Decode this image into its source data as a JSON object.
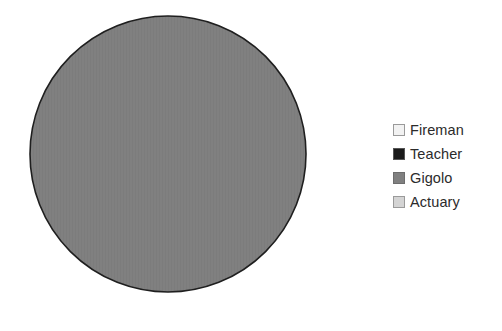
{
  "chart_data": {
    "type": "pie",
    "title": "",
    "subtitle": "",
    "xlabel": "",
    "ylabel": "",
    "grid": false,
    "legend_position": "right",
    "categories": [
      "Fireman",
      "Teacher",
      "Gigolo",
      "Actuary"
    ],
    "values": [
      0,
      0,
      100,
      0
    ],
    "value_unit": "%",
    "data_labels_shown": false,
    "slices": [
      {
        "label": "Fireman",
        "value": 0,
        "color": "#f2f2f2",
        "start_angle": 0,
        "end_angle": 0
      },
      {
        "label": "Teacher",
        "value": 0,
        "color": "#1a1a1a",
        "start_angle": 0,
        "end_angle": 0
      },
      {
        "label": "Gigolo",
        "value": 100,
        "color": "#808080",
        "start_angle": 0,
        "end_angle": 360
      },
      {
        "label": "Actuary",
        "value": 0,
        "color": "#d4d4d4",
        "start_angle": 360,
        "end_angle": 360
      }
    ]
  },
  "pie": {
    "center_x": 168,
    "center_y": 154,
    "radius": 138,
    "fill_color": "#808080",
    "outline_color": "#1f1f1f",
    "outline_width": 1.6
  },
  "legend": {
    "items": [
      {
        "label": "Fireman",
        "color": "#f2f2f2",
        "border": "#9a9a9a"
      },
      {
        "label": "Teacher",
        "color": "#1a1a1a",
        "border": "#555555"
      },
      {
        "label": "Gigolo",
        "color": "#808080",
        "border": "#6d6d6d"
      },
      {
        "label": "Actuary",
        "color": "#d4d4d4",
        "border": "#9a9a9a"
      }
    ]
  },
  "canvas": {
    "background": "#ffffff",
    "width": 502,
    "height": 331
  }
}
